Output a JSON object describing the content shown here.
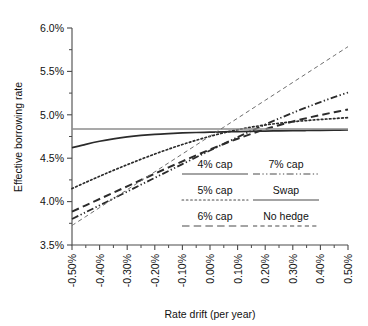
{
  "chart_data": {
    "type": "line",
    "title": "",
    "xlabel": "Rate drift (per year)",
    "ylabel": "Effective borrowing rate",
    "xlim": [
      -0.5,
      0.5
    ],
    "ylim": [
      3.5,
      6.0
    ],
    "grid": false,
    "legend_position": "inside-bottom-right",
    "x_tick_labels": [
      "-0.50%",
      "-0.40%",
      "-0.30%",
      "-0.20%",
      "-0.10%",
      "0.00%",
      "0.10%",
      "0.20%",
      "0.30%",
      "0.40%",
      "0.50%"
    ],
    "x_tick_values": [
      -0.5,
      -0.4,
      -0.3,
      -0.2,
      -0.1,
      0.0,
      0.1,
      0.2,
      0.3,
      0.4,
      0.5
    ],
    "x_minor_step": 0.05,
    "y_tick_labels": [
      "3.5%",
      "4.0%",
      "4.5%",
      "5.0%",
      "5.5%",
      "6.0%"
    ],
    "y_tick_values": [
      3.5,
      4.0,
      4.5,
      5.0,
      5.5,
      6.0
    ],
    "y_minor_step": 0.25,
    "x": [
      -0.5,
      -0.45,
      -0.4,
      -0.35,
      -0.3,
      -0.25,
      -0.2,
      -0.15,
      -0.1,
      -0.05,
      0.0,
      0.05,
      0.1,
      0.15,
      0.2,
      0.25,
      0.3,
      0.35,
      0.4,
      0.45,
      0.5
    ],
    "series": [
      {
        "name": "4% cap",
        "style": "solid",
        "width": 1.7,
        "color": "#2b2b2b",
        "values": [
          4.62,
          4.66,
          4.695,
          4.723,
          4.745,
          4.762,
          4.775,
          4.784,
          4.791,
          4.796,
          4.8,
          4.804,
          4.807,
          4.81,
          4.813,
          4.815,
          4.817,
          4.819,
          4.821,
          4.823,
          4.825
        ]
      },
      {
        "name": "5% cap",
        "style": "dotted",
        "width": 1.7,
        "color": "#2b2b2b",
        "values": [
          4.15,
          4.222,
          4.292,
          4.36,
          4.425,
          4.488,
          4.548,
          4.605,
          4.658,
          4.707,
          4.752,
          4.793,
          4.828,
          4.858,
          4.883,
          4.903,
          4.92,
          4.934,
          4.946,
          4.957,
          4.967
        ]
      },
      {
        "name": "6% cap",
        "style": "dashed-long",
        "width": 2.0,
        "color": "#2b2b2b",
        "values": [
          3.885,
          3.957,
          4.03,
          4.103,
          4.176,
          4.249,
          4.322,
          4.394,
          4.464,
          4.533,
          4.6,
          4.664,
          4.724,
          4.781,
          4.833,
          4.88,
          4.923,
          4.962,
          4.997,
          5.03,
          5.06
        ]
      },
      {
        "name": "7% cap",
        "style": "dash-dot-dot",
        "width": 1.8,
        "color": "#2b2b2b",
        "values": [
          3.8,
          3.878,
          3.957,
          4.036,
          4.115,
          4.195,
          4.274,
          4.353,
          4.432,
          4.511,
          4.589,
          4.666,
          4.742,
          4.816,
          4.888,
          4.957,
          5.023,
          5.086,
          5.146,
          5.203,
          5.257
        ]
      },
      {
        "name": "Swap",
        "style": "solid",
        "width": 1.5,
        "color": "#8c8c8c",
        "values": [
          4.835,
          4.835,
          4.835,
          4.835,
          4.835,
          4.835,
          4.835,
          4.835,
          4.835,
          4.835,
          4.835,
          4.835,
          4.835,
          4.835,
          4.835,
          4.835,
          4.835,
          4.835,
          4.835,
          4.835,
          4.835
        ]
      },
      {
        "name": "No hedge",
        "style": "dashed-thin",
        "width": 1.0,
        "color": "#6e6e6e",
        "values": [
          3.725,
          3.828,
          3.931,
          4.034,
          4.137,
          4.24,
          4.343,
          4.446,
          4.549,
          4.652,
          4.755,
          4.858,
          4.961,
          5.064,
          5.167,
          5.27,
          5.373,
          5.476,
          5.579,
          5.682,
          5.785
        ]
      }
    ],
    "legend": {
      "entries": [
        {
          "label": "4% cap",
          "style": "solid",
          "width": 1.8,
          "color": "#2b2b2b"
        },
        {
          "label": "7% cap",
          "style": "dash-dot-dot",
          "width": 1.8,
          "color": "#2b2b2b"
        },
        {
          "label": "5% cap",
          "style": "dotted",
          "width": 1.8,
          "color": "#2b2b2b"
        },
        {
          "label": "Swap",
          "style": "solid",
          "width": 1.3,
          "color": "#8c8c8c"
        },
        {
          "label": "6% cap",
          "style": "dashed-long",
          "width": 2.2,
          "color": "#2b2b2b"
        },
        {
          "label": "No hedge",
          "style": "dashed-thin",
          "width": 1.1,
          "color": "#6e6e6e"
        }
      ]
    }
  }
}
